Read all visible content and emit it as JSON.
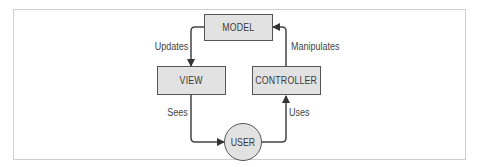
{
  "diagram": {
    "nodes": {
      "model": {
        "label": "MODEL",
        "shape": "rectangle"
      },
      "view": {
        "label": "VIEW",
        "shape": "rectangle"
      },
      "controller": {
        "label": "CONTROLLER",
        "shape": "rectangle"
      },
      "user": {
        "label": "USER",
        "shape": "circle"
      }
    },
    "edges": [
      {
        "from": "MODEL",
        "to": "VIEW",
        "label": "Updates"
      },
      {
        "from": "CONTROLLER",
        "to": "MODEL",
        "label": "Manipulates"
      },
      {
        "from": "VIEW",
        "to": "USER",
        "label": "Sees"
      },
      {
        "from": "USER",
        "to": "CONTROLLER",
        "label": "Uses"
      }
    ],
    "colors": {
      "node_fill": "#e2e2e2",
      "node_border": "#555555",
      "edge": "#444444",
      "frame_border": "#cfcfcf"
    }
  }
}
